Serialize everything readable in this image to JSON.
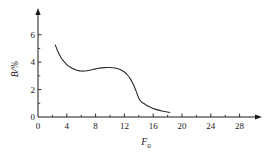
{
  "chart_data": {
    "type": "line",
    "title": "",
    "subtitle": "",
    "xlabel": "F0",
    "xlabel_base": "F",
    "xlabel_sub": "0",
    "ylabel": "B/%",
    "xlim": [
      0,
      30
    ],
    "ylim": [
      0,
      7
    ],
    "xticks": [
      0,
      4,
      8,
      12,
      16,
      20,
      24,
      28
    ],
    "xtick_labels": [
      "0",
      "4",
      "8",
      "12",
      "16",
      "20",
      "24",
      "28"
    ],
    "yticks": [
      0,
      2,
      4,
      6
    ],
    "ytick_labels": [
      "0",
      "2",
      "4",
      "6"
    ],
    "x_minor_step": 2,
    "y_minor_step": 1,
    "grid": false,
    "legend": null,
    "annotations": [],
    "line_color": "#2b2b2b",
    "line_width": 1.1,
    "axis_color": "#1a1a1a",
    "background": "#ffffff",
    "series": [
      {
        "name": "B",
        "x": [
          2.4,
          2.7,
          3.0,
          3.3,
          3.6,
          4.0,
          4.4,
          4.8,
          5.2,
          5.6,
          6.0,
          6.4,
          6.8,
          7.2,
          7.6,
          8.0,
          8.4,
          8.8,
          9.2,
          9.6,
          10.0,
          10.4,
          10.8,
          11.2,
          11.6,
          12.0,
          12.4,
          12.8,
          13.2,
          13.6,
          13.9,
          14.1,
          14.3,
          14.6,
          15.0,
          15.5,
          16.0,
          16.6,
          17.2,
          17.8,
          18.3
        ],
        "y": [
          5.25,
          4.85,
          4.52,
          4.25,
          4.05,
          3.82,
          3.66,
          3.53,
          3.44,
          3.38,
          3.35,
          3.35,
          3.37,
          3.41,
          3.46,
          3.51,
          3.55,
          3.58,
          3.6,
          3.61,
          3.61,
          3.59,
          3.56,
          3.5,
          3.41,
          3.28,
          3.08,
          2.8,
          2.42,
          1.92,
          1.5,
          1.28,
          1.14,
          1.02,
          0.88,
          0.74,
          0.62,
          0.52,
          0.44,
          0.38,
          0.33
        ]
      }
    ]
  },
  "figure": {
    "x_axis_name": "x-axis",
    "y_axis_name": "y-axis"
  }
}
